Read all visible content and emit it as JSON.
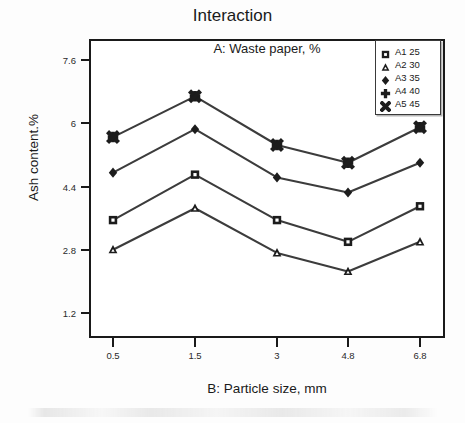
{
  "chart_data": {
    "type": "line",
    "title": "Interaction",
    "subtitle": "A: Waste  paper, %",
    "xlabel": "B: Particle size, mm",
    "ylabel": "Ash content.%",
    "categories": [
      "0.5",
      "1.5",
      "3",
      "4.8",
      "6.8"
    ],
    "x_tick_labels": [
      "0.5",
      "1.5",
      "3",
      "4.8",
      "6.8"
    ],
    "y_tick_labels": [
      "7.6",
      "6",
      "4.4",
      "2.8",
      "1.2"
    ],
    "y_tick_values": [
      7.6,
      6,
      4.4,
      2.8,
      1.2
    ],
    "ylim": [
      0.72,
      8.0
    ],
    "grid": false,
    "legend_position": "top-right-inside",
    "series": [
      {
        "name": "A1 25",
        "marker": "square",
        "values": [
          3.55,
          4.7,
          3.55,
          3.0,
          3.9
        ]
      },
      {
        "name": "A2 30",
        "marker": "triangle",
        "values": [
          2.8,
          3.85,
          2.72,
          2.25,
          3.0
        ]
      },
      {
        "name": "A3 35",
        "marker": "diamond",
        "values": [
          4.75,
          5.85,
          4.63,
          4.25,
          5.0
        ]
      },
      {
        "name": "A4 40",
        "marker": "plus-diamond",
        "values": [
          5.65,
          6.68,
          5.45,
          5.0,
          5.9
        ]
      },
      {
        "name": "A5 45",
        "marker": "cross",
        "values": [
          5.65,
          6.68,
          5.45,
          5.0,
          5.9
        ]
      }
    ]
  },
  "legend": {
    "entries": [
      {
        "label": "A1 25",
        "marker": "square-icon"
      },
      {
        "label": "A2 30",
        "marker": "triangle-icon"
      },
      {
        "label": "A3 35",
        "marker": "diamond-icon"
      },
      {
        "label": "A4 40",
        "marker": "plus-diamond-icon"
      },
      {
        "label": "A5 45",
        "marker": "cross-icon"
      }
    ]
  },
  "colors": {
    "line": "#3c3c3c",
    "marker": "#1c1c1c",
    "axis": "#1a1a1a",
    "text": "#1a1a1a",
    "background": "#ffffff"
  }
}
